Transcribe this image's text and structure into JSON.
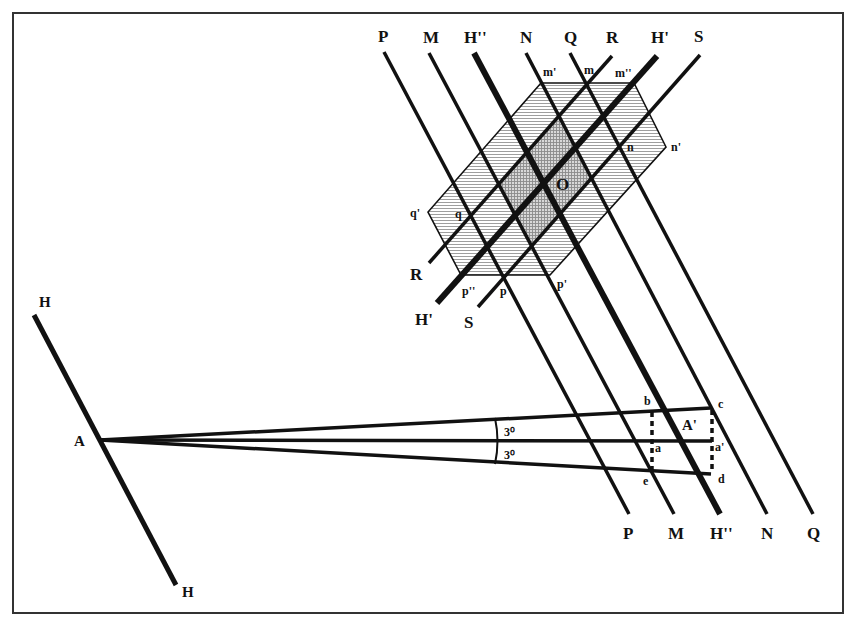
{
  "frame": {
    "x": 13,
    "y": 13,
    "width": 830,
    "height": 600,
    "stroke": "#333333"
  },
  "colors": {
    "ink": "#111111",
    "hatch_light": "#bdbdbd",
    "hatch_dark": "#9a9a9a",
    "background": "#ffffff"
  },
  "hexagon": {
    "points": [
      [
        541,
        83
      ],
      [
        634,
        83
      ],
      [
        666,
        147
      ],
      [
        550,
        275
      ],
      [
        461,
        275
      ],
      [
        428,
        212
      ]
    ],
    "vertex_labels": [
      {
        "text": "m'",
        "x": 543,
        "y": 76
      },
      {
        "text": "m",
        "x": 584,
        "y": 74
      },
      {
        "text": "m''",
        "x": 615,
        "y": 77
      },
      {
        "text": "n",
        "x": 627,
        "y": 151
      },
      {
        "text": "n'",
        "x": 671,
        "y": 151
      },
      {
        "text": "q'",
        "x": 410,
        "y": 217
      },
      {
        "text": "q",
        "x": 455,
        "y": 218
      },
      {
        "text": "p''",
        "x": 462,
        "y": 295
      },
      {
        "text": "p",
        "x": 500,
        "y": 295
      },
      {
        "text": "p'",
        "x": 557,
        "y": 288
      }
    ]
  },
  "center_label": {
    "text": "O",
    "x": 556,
    "y": 190
  },
  "parallel_lines": [
    {
      "id": "P",
      "x1": 384,
      "y1": 52,
      "x2": 629,
      "y2": 514,
      "width": 3.5,
      "top_label": "P",
      "bottom_label": "P"
    },
    {
      "id": "M",
      "x1": 429,
      "y1": 53,
      "x2": 674,
      "y2": 514,
      "width": 3.5,
      "top_label": "M",
      "bottom_label": "M"
    },
    {
      "id": "H2",
      "x1": 474,
      "y1": 53,
      "x2": 720,
      "y2": 514,
      "width": 6,
      "top_label": "H''",
      "bottom_label": "H''"
    },
    {
      "id": "N",
      "x1": 526,
      "y1": 53,
      "x2": 767,
      "y2": 514,
      "width": 3.5,
      "top_label": "N",
      "bottom_label": "N"
    },
    {
      "id": "Q",
      "x1": 570,
      "y1": 53,
      "x2": 813,
      "y2": 514,
      "width": 3.5,
      "top_label": "Q",
      "bottom_label": "Q"
    }
  ],
  "cross_lines": [
    {
      "id": "R",
      "x1": 612,
      "y1": 56,
      "x2": 429,
      "y2": 263,
      "width": 3.5,
      "top_label": "R",
      "bottom_label": "R",
      "bottom_label_pos": [
        410,
        280
      ]
    },
    {
      "id": "H1",
      "x1": 657,
      "y1": 56,
      "x2": 437,
      "y2": 303,
      "width": 6,
      "top_label": "H'",
      "bottom_label": "H'",
      "bottom_label_pos": [
        415,
        325
      ]
    },
    {
      "id": "S",
      "x1": 700,
      "y1": 55,
      "x2": 478,
      "y2": 307,
      "width": 3.5,
      "top_label": "S",
      "bottom_label": "S",
      "bottom_label_pos": [
        464,
        328
      ]
    }
  ],
  "dark_region_lines": {
    "a": [
      "M",
      "N"
    ],
    "b": [
      "R",
      "S"
    ]
  },
  "h_line": {
    "x1": 34,
    "y1": 315,
    "x2": 176,
    "y2": 585,
    "width": 5,
    "top_label": "H",
    "bottom_label": "H"
  },
  "point_A": {
    "x": 100,
    "y": 440,
    "label": "A"
  },
  "rays": [
    {
      "x2": 711,
      "y2": 408,
      "width": 3.5
    },
    {
      "x2": 712,
      "y2": 441,
      "width": 3.5
    },
    {
      "x2": 711,
      "y2": 474,
      "width": 3.5
    }
  ],
  "angle_arc": {
    "x": 495,
    "y1": 418,
    "y2": 464,
    "labels": [
      {
        "text": "3⁰",
        "x": 504,
        "y": 436
      },
      {
        "text": "3⁰",
        "x": 504,
        "y": 459
      }
    ]
  },
  "dotted_lines": [
    {
      "x1": 652,
      "y1": 412,
      "x2": 652,
      "y2": 470
    },
    {
      "x1": 712,
      "y1": 410,
      "x2": 712,
      "y2": 472
    }
  ],
  "point_labels": [
    {
      "text": "b",
      "x": 644,
      "y": 405
    },
    {
      "text": "c",
      "x": 718,
      "y": 408
    },
    {
      "text": "A'",
      "x": 682,
      "y": 430
    },
    {
      "text": "a",
      "x": 655,
      "y": 452
    },
    {
      "text": "a'",
      "x": 715,
      "y": 451
    },
    {
      "text": "d",
      "x": 718,
      "y": 483
    },
    {
      "text": "e",
      "x": 643,
      "y": 485
    }
  ]
}
